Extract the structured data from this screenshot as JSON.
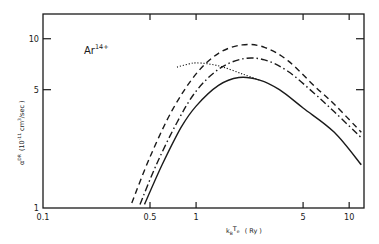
{
  "chart_data": {
    "type": "line",
    "title": "",
    "annotation": "Ar",
    "annotation_sup": "14+",
    "xlabel": "kT_e (Ry)",
    "xlabel_parts": {
      "main": "k",
      "sub": "B",
      "t": "T",
      "tsub": "e",
      "unit": "( Ry )"
    },
    "ylabel": "α^DR (10^-11 cm^3/sec)",
    "ylabel_parts": {
      "alpha": "α",
      "sup": "DR",
      "unit_open": "(10",
      "exp": "-11",
      "unit_mid": "cm",
      "cube": "3",
      "unit_close": "/sec )"
    },
    "xscale": "log",
    "yscale": "log",
    "xlim": [
      0.1,
      12.5
    ],
    "ylim": [
      1,
      14
    ],
    "x_ticks": [
      0.1,
      0.5,
      1,
      5,
      10
    ],
    "x_tick_labels": [
      "0.1",
      "0.5",
      "1",
      "5",
      "10"
    ],
    "y_ticks": [
      1,
      5,
      10
    ],
    "y_tick_labels": [
      "1",
      "5",
      "10"
    ],
    "grid": false,
    "legend": "none",
    "series": [
      {
        "name": "dashed",
        "style": "dashed",
        "x": [
          0.38,
          0.5,
          0.7,
          1.0,
          1.4,
          2.0,
          2.8,
          4.0,
          6.0,
          8.0,
          12.0
        ],
        "values": [
          1.07,
          2.0,
          3.8,
          6.2,
          8.2,
          9.2,
          8.9,
          7.4,
          5.2,
          4.1,
          2.8
        ]
      },
      {
        "name": "dash-dot",
        "style": "dashdot",
        "x": [
          0.43,
          0.55,
          0.75,
          1.0,
          1.4,
          2.0,
          2.8,
          4.0,
          6.0,
          8.0,
          12.0
        ],
        "values": [
          1.05,
          1.8,
          3.2,
          4.9,
          6.6,
          7.6,
          7.5,
          6.4,
          4.7,
          3.7,
          2.6
        ]
      },
      {
        "name": "solid",
        "style": "solid",
        "x": [
          0.46,
          0.6,
          0.8,
          1.0,
          1.4,
          1.9,
          2.6,
          3.5,
          5.0,
          8.0,
          12.0
        ],
        "values": [
          1.05,
          1.8,
          3.0,
          4.0,
          5.3,
          5.9,
          5.7,
          5.0,
          3.9,
          2.8,
          1.8
        ]
      },
      {
        "name": "dotted",
        "style": "dotted",
        "x": [
          0.75,
          0.9,
          1.0,
          1.2,
          1.5,
          2.0,
          2.6
        ],
        "values": [
          6.8,
          7.1,
          7.2,
          7.1,
          6.8,
          6.2,
          5.7
        ]
      }
    ]
  }
}
